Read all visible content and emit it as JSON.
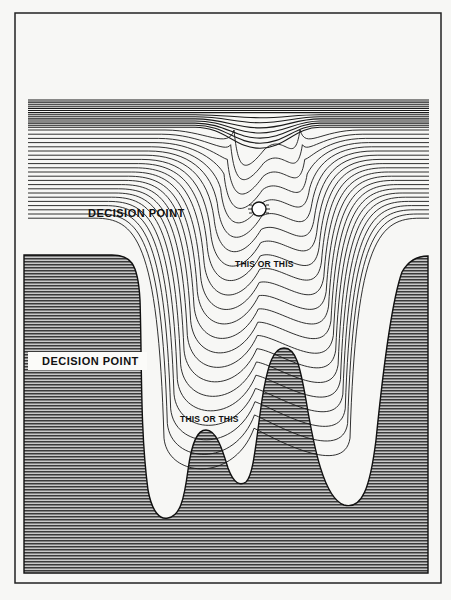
{
  "figure": {
    "frame": {
      "x": 15,
      "y": 13,
      "width": 426,
      "height": 570
    },
    "colors": {
      "background": "#f7f7f5",
      "line": "#1a1a1a",
      "hatch_dark": "#2a2a2a",
      "hatch_light": "#bdbdbd",
      "frame": "#222222"
    },
    "labels": [
      {
        "id": "decision-point-upper",
        "text": "DECISION POINT",
        "x": 88,
        "y": 207
      },
      {
        "id": "decision-point-lower",
        "text": "DECISION POINT",
        "x": 28,
        "y": 355
      },
      {
        "id": "this-or-this-upper",
        "text": "THIS OR THIS",
        "x": 235,
        "y": 259
      },
      {
        "id": "this-or-this-lower",
        "text": "THIS OR THIS",
        "x": 180,
        "y": 414
      }
    ],
    "ball": {
      "cx": 259,
      "cy": 209,
      "r": 7
    }
  }
}
